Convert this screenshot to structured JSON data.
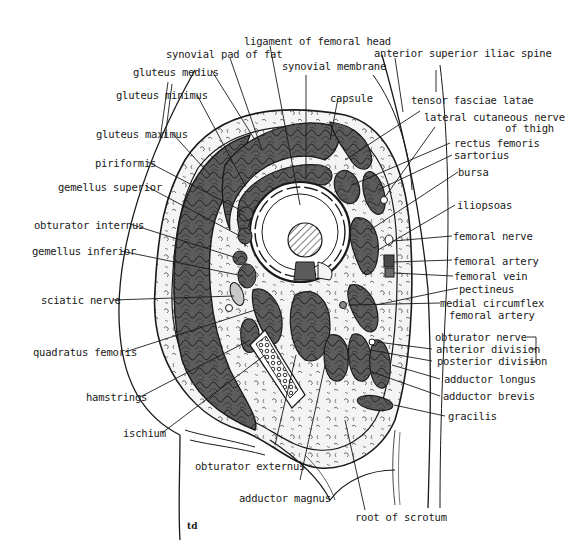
{
  "diagram": {
    "signature": "td",
    "colors": {
      "muscle": "#5c5c5c",
      "muscle_stroke": "#1a1a1a",
      "fat": "#f4f4f4",
      "line": "#1a1a1a",
      "background": "#ffffff"
    },
    "labels_top": {
      "ligament_femoral_head": "ligament of femoral head",
      "synovial_pad": "synovial pad of fat",
      "gluteus_medius": "gluteus medius",
      "gluteus_minimus": "gluteus minimus",
      "synovial_membrane": "synovial membrane",
      "asis": "anterior superior iliac spine",
      "capsule": "capsule"
    },
    "labels_left": {
      "gluteus_maximus": "gluteus maximus",
      "piriformis": "piriformis",
      "gemellus_superior": "gemellus superior",
      "obturator_internus": "obturator internus",
      "gemellus_inferior": "gemellus inferior",
      "sciatic_nerve": "sciatic nerve",
      "quadratus_femoris": "quadratus femoris",
      "hamstrings": "hamstrings",
      "ischium": "ischium"
    },
    "labels_right": {
      "tensor_fasciae_latae": "tensor fasciae latae",
      "lateral_cutaneous_1": "lateral cutaneous nerve",
      "lateral_cutaneous_2": "of thigh",
      "rectus_femoris": "rectus femoris",
      "sartorius": "sartorius",
      "bursa": "bursa",
      "iliopsoas": "iliopsoas",
      "femoral_nerve": "femoral nerve",
      "femoral_artery": "femoral artery",
      "femoral_vein": "femoral vein",
      "pectineus": "pectineus",
      "medial_circumflex_1": "medial circumflex",
      "medial_circumflex_2": "femoral artery",
      "obturator_nerve": "obturator nerve",
      "anterior_division": "anterior division",
      "posterior_division": "posterior division",
      "adductor_longus": "adductor longus",
      "adductor_brevis": "adductor brevis",
      "gracilis": "gracilis"
    },
    "labels_bottom": {
      "obturator_externus": "obturator externus",
      "adductor_magnus": "adductor magnus",
      "root_of_scrotum": "root of scrotum"
    }
  }
}
